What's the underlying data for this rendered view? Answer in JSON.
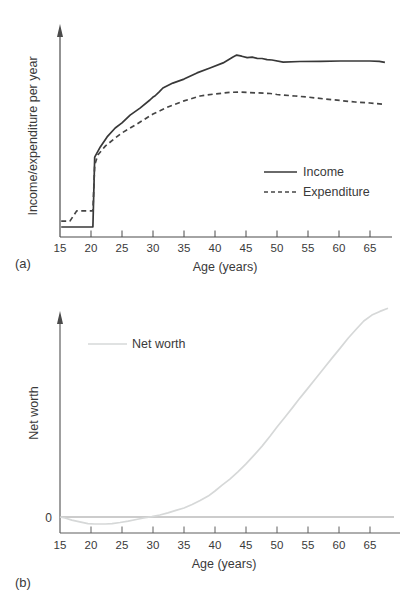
{
  "figure": {
    "background": "#ffffff",
    "panel_labels": {
      "a": "(a)",
      "b": "(b)"
    }
  },
  "colors": {
    "income_line": "#383838",
    "expenditure_line": "#454545",
    "net_worth_line": "#d6d8d8",
    "zero_line": "#9a9a9a",
    "axis_a": "#4b4b4b",
    "axis_b": "#5f5f5f",
    "text": "#3a3a3a"
  },
  "chart_data": [
    {
      "type": "line",
      "panel_label": "(a)",
      "title": "",
      "xlabel": "Age (years)",
      "ylabel": "Income/expenditure per year",
      "x_ticks": [
        15,
        20,
        25,
        30,
        35,
        40,
        45,
        50,
        55,
        60,
        65
      ],
      "xlim": [
        15,
        67.5
      ],
      "ylim": [
        0,
        100
      ],
      "y_axis_numeric_labels": false,
      "grid": false,
      "legend": {
        "position": "middle-right",
        "entries": [
          "Income",
          "Expenditure"
        ]
      },
      "note": "y values are relative units read from unlabeled axis (0 = x-axis, 100 = top of plot)",
      "series": [
        {
          "name": "Income",
          "style": "solid",
          "color": "#383838",
          "points": [
            [
              15.2,
              4.7
            ],
            [
              20.3,
              4.7
            ],
            [
              20.6,
              37.7
            ],
            [
              21.5,
              42.5
            ],
            [
              22.6,
              47.2
            ],
            [
              23.9,
              51.4
            ],
            [
              25,
              53.8
            ],
            [
              26.3,
              57.5
            ],
            [
              27.9,
              60.8
            ],
            [
              29.5,
              64.6
            ],
            [
              30,
              66
            ],
            [
              30.3,
              66.5
            ],
            [
              31,
              68.5
            ],
            [
              31.6,
              70.3
            ],
            [
              33.2,
              72.6
            ],
            [
              35,
              74.5
            ],
            [
              37.1,
              77.4
            ],
            [
              39.2,
              79.7
            ],
            [
              41.3,
              82.1
            ],
            [
              42.9,
              84.9
            ],
            [
              43.5,
              85.8
            ],
            [
              44.3,
              85.3
            ],
            [
              45.2,
              84.6
            ],
            [
              46,
              84.8
            ],
            [
              46.8,
              84.3
            ],
            [
              47.6,
              84.2
            ],
            [
              48.4,
              83.7
            ],
            [
              49.2,
              83.5
            ],
            [
              51,
              82.5
            ],
            [
              53.7,
              82.8
            ],
            [
              57,
              82.9
            ],
            [
              60.2,
              83
            ],
            [
              65,
              83
            ],
            [
              66.5,
              82.9
            ],
            [
              67.4,
              82.4
            ]
          ]
        },
        {
          "name": "Expenditure",
          "style": "dashed",
          "color": "#454545",
          "points": [
            [
              15.2,
              7.5
            ],
            [
              16.6,
              7.5
            ],
            [
              17.7,
              12.3
            ],
            [
              20.3,
              12.3
            ],
            [
              20.6,
              34
            ],
            [
              21.1,
              38.7
            ],
            [
              22.3,
              42.9
            ],
            [
              23.9,
              46.7
            ],
            [
              25,
              49.1
            ],
            [
              27.4,
              53.3
            ],
            [
              30,
              58
            ],
            [
              32.4,
              61.3
            ],
            [
              35,
              64.2
            ],
            [
              37.6,
              66.5
            ],
            [
              40,
              67.5
            ],
            [
              42.4,
              68.2
            ],
            [
              44,
              68.4
            ],
            [
              46.5,
              68
            ],
            [
              48.9,
              67.7
            ],
            [
              50,
              67.2
            ],
            [
              52.9,
              66.5
            ],
            [
              55,
              66
            ],
            [
              57.7,
              65.1
            ],
            [
              60.2,
              64.4
            ],
            [
              62.6,
              63.7
            ],
            [
              65,
              63.2
            ],
            [
              67.4,
              62.5
            ]
          ]
        }
      ]
    },
    {
      "type": "line",
      "panel_label": "(b)",
      "title": "",
      "xlabel": "Age (years)",
      "ylabel": "Net worth",
      "x_ticks": [
        15,
        20,
        25,
        30,
        35,
        40,
        45,
        50,
        55,
        60,
        65
      ],
      "xlim": [
        15,
        67.5
      ],
      "ylim": [
        -10,
        105
      ],
      "zero_line": true,
      "zero_label": "0",
      "grid": false,
      "legend": {
        "position": "top-left",
        "entries": [
          "Net worth"
        ]
      },
      "note": "y values are relative units read from unlabeled axis (0 = horizontal zero line, 100 near top of plot); curve dips below 0 from ~age 16 to ~age 30, minimum near age 21",
      "series": [
        {
          "name": "Net worth",
          "style": "solid",
          "color": "#d6d8d8",
          "points": [
            [
              15,
              0
            ],
            [
              15.8,
              -0.5
            ],
            [
              16.9,
              -1.5
            ],
            [
              18.2,
              -2.4
            ],
            [
              19.5,
              -3.2
            ],
            [
              20.6,
              -3.4
            ],
            [
              22.3,
              -3.4
            ],
            [
              23.4,
              -3.2
            ],
            [
              24.7,
              -2.7
            ],
            [
              26,
              -2
            ],
            [
              27.3,
              -1.2
            ],
            [
              28.5,
              -0.5
            ],
            [
              29.8,
              0.2
            ],
            [
              31.1,
              1
            ],
            [
              32.4,
              2
            ],
            [
              33.7,
              3.2
            ],
            [
              35,
              4.4
            ],
            [
              36.3,
              6.1
            ],
            [
              37.6,
              8
            ],
            [
              38.9,
              10.2
            ],
            [
              40,
              12.7
            ],
            [
              41.1,
              15.4
            ],
            [
              42.4,
              18.5
            ],
            [
              43.7,
              22
            ],
            [
              45,
              25.9
            ],
            [
              46.3,
              30.2
            ],
            [
              47.6,
              34.6
            ],
            [
              48.9,
              39.5
            ],
            [
              50,
              43.9
            ],
            [
              51.3,
              48.8
            ],
            [
              52.6,
              53.7
            ],
            [
              53.7,
              58
            ],
            [
              55,
              62.9
            ],
            [
              56.3,
              67.8
            ],
            [
              57.6,
              72.7
            ],
            [
              58.9,
              77.6
            ],
            [
              60.2,
              82.4
            ],
            [
              61.5,
              87.3
            ],
            [
              62.8,
              91.7
            ],
            [
              64,
              95.6
            ],
            [
              65.3,
              98.5
            ],
            [
              66.6,
              100.3
            ],
            [
              67.9,
              101.8
            ]
          ]
        }
      ]
    }
  ]
}
